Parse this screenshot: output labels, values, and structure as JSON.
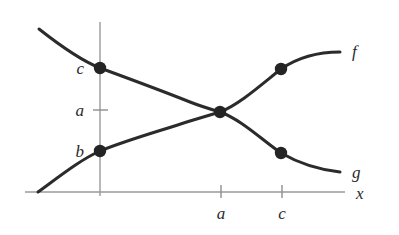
{
  "figure": {
    "background_color": "#ffffff",
    "curve_color": "#2b2b2b",
    "axis_color": "#9a9a9a",
    "dot_color": "#242424"
  },
  "axes": {
    "x_axis_label": "x",
    "y_axis_label": "",
    "x_ticks": [
      {
        "label": "a",
        "x": 221
      },
      {
        "label": "c",
        "x": 282
      }
    ],
    "y_ticks": [
      {
        "label": "c",
        "y": 68,
        "has_tick_mark": false
      },
      {
        "label": "a",
        "y": 110,
        "has_tick_mark": true
      },
      {
        "label": "b",
        "y": 151,
        "has_tick_mark": false
      }
    ]
  },
  "curves": [
    {
      "name": "f",
      "label": "f",
      "behavior": "increasing",
      "label_x": 352,
      "label_y": 57,
      "path": "M 38 192 C 60 176, 80 160, 100 151 C 130 139, 160 131, 190 121 C 200 118, 210 115, 220 112 C 240 104, 262 84, 281 69 C 300 56, 322 52, 340 52"
    },
    {
      "name": "g",
      "label": "g",
      "behavior": "decreasing",
      "label_x": 352,
      "label_y": 178,
      "path": "M 39 29 C 58 44, 80 60, 100 68 C 130 79, 160 90, 190 102 C 200 106, 210 109, 220 112 C 242 120, 262 140, 281 153 C 300 164, 322 170, 340 172"
    }
  ],
  "points": [
    {
      "name": "g-y-intercept",
      "x": 100,
      "y": 68,
      "label": "c",
      "axis": "y"
    },
    {
      "name": "f-y-intercept",
      "x": 100,
      "y": 151,
      "label": "b",
      "axis": "y"
    },
    {
      "name": "intersection",
      "x": 220,
      "y": 112,
      "label": "a",
      "axis": "y"
    },
    {
      "name": "f-at-c",
      "x": 281,
      "y": 69,
      "label": "",
      "axis": ""
    },
    {
      "name": "g-at-c",
      "x": 281,
      "y": 153,
      "label": "",
      "axis": ""
    }
  ],
  "chart_data": {
    "type": "line",
    "title": "",
    "xlabel": "x",
    "ylabel": "",
    "grid": false,
    "legend": "inline-right-labels",
    "annotations": [
      "c is the y-value of g at x=0",
      "b is the y-value of f at x=0",
      "a is the y-value at the intersection of f and g, occurring at x=a",
      "c on the x-axis marks a second pair of marked points on f and g"
    ],
    "series": [
      {
        "name": "f",
        "description": "increasing concave curve rising from the x-axis through b at x=0 to the intersection at x=a and beyond",
        "x": [
          0,
          1,
          2,
          3,
          4,
          5,
          6
        ],
        "values": [
          0,
          1.5,
          2.2,
          2.6,
          3.0,
          3.9,
          4.3
        ]
      },
      {
        "name": "g",
        "description": "decreasing curve falling from upper-left through c at x=0 to the intersection at x=a and beyond",
        "x": [
          0,
          1,
          2,
          3,
          4,
          5,
          6
        ],
        "values": [
          5.4,
          4.3,
          3.9,
          3.5,
          3.0,
          2.1,
          1.6
        ]
      }
    ]
  }
}
